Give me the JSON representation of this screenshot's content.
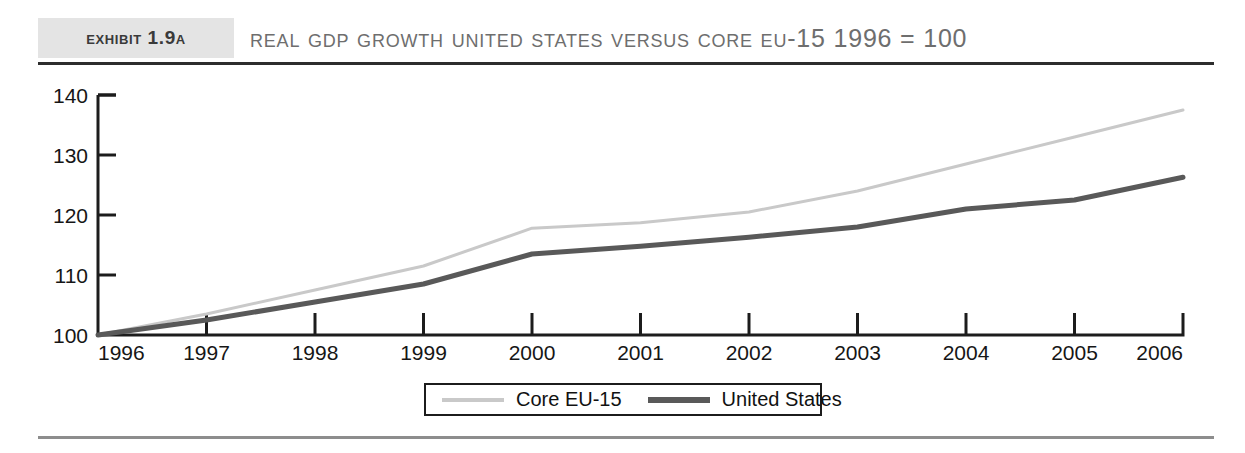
{
  "header": {
    "exhibit_tag": "Exhibit 1.9A",
    "title": "Real GDP Growth United States versus Core EU-15 1996 = 100"
  },
  "legend": {
    "items": [
      {
        "label": "Core EU-15",
        "color": "#c9c9c9",
        "swatch": "line-swatch-light"
      },
      {
        "label": "United States",
        "color": "#595959",
        "swatch": "line-swatch-dark"
      }
    ]
  },
  "chart_data": {
    "type": "line",
    "title": "Real GDP Growth United States versus Core EU-15 1996 = 100",
    "xlabel": "",
    "ylabel": "",
    "x": [
      1996,
      1997,
      1998,
      1999,
      2000,
      2001,
      2002,
      2003,
      2004,
      2005,
      2006
    ],
    "categories": [
      "1996",
      "1997",
      "1998",
      "1999",
      "2000",
      "2001",
      "2002",
      "2003",
      "2004",
      "2005",
      "2006"
    ],
    "xlim": [
      1996,
      2006
    ],
    "ylim": [
      100,
      140
    ],
    "yticks": [
      100,
      110,
      120,
      130,
      140
    ],
    "ytick_labels": [
      "100",
      "110",
      "120",
      "130",
      "140"
    ],
    "grid": false,
    "legend_position": "bottom",
    "series": [
      {
        "name": "Core EU-15",
        "color": "#c9c9c9",
        "width": 3,
        "values": [
          100,
          103.5,
          107.5,
          111.5,
          117.8,
          118.7,
          120.5,
          124.0,
          128.5,
          133.0,
          137.5
        ]
      },
      {
        "name": "United States",
        "color": "#595959",
        "width": 5,
        "values": [
          100,
          102.5,
          105.5,
          108.5,
          113.5,
          114.8,
          116.3,
          118.0,
          121.0,
          122.5,
          126.3
        ]
      }
    ]
  }
}
